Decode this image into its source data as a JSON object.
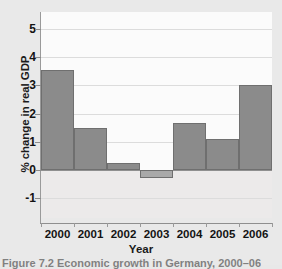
{
  "chart_data": {
    "type": "bar",
    "title": "",
    "xlabel": "Year",
    "ylabel": "% change in real GDP",
    "categories": [
      "2000",
      "2001",
      "2002",
      "2003",
      "2004",
      "2005",
      "2006"
    ],
    "values": [
      3.55,
      1.5,
      0.25,
      -0.3,
      1.65,
      1.1,
      3.0
    ],
    "ylim": [
      -1.7,
      5.6
    ],
    "yticks": [
      -1,
      0,
      1,
      2,
      3,
      4,
      5
    ],
    "ytick_labels": [
      "-1",
      "0",
      "1",
      "2",
      "3",
      "4",
      "5"
    ],
    "grid": true,
    "legend": "none",
    "series": [
      {
        "name": "% change in real GDP",
        "values": [
          3.55,
          1.5,
          0.25,
          -0.3,
          1.65,
          1.1,
          3.0
        ]
      }
    ],
    "bar_color": "#8b8b8b",
    "bar_edge_color": "#6f6f6f",
    "plot_background": "#fbfbfb",
    "figure_background": "#e9e9e9"
  },
  "caption": {
    "text": "Figure  7.2 Economic growth in Germany, 2000–06"
  }
}
